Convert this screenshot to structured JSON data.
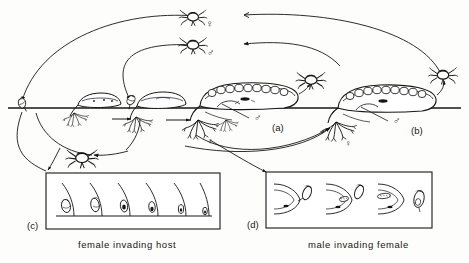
{
  "figure": {
    "background_color": "#fdfdfc",
    "ink_color": "#161616",
    "width": 469,
    "height": 263
  },
  "panels": [
    {
      "id": "a",
      "letter": "(a)",
      "x": 272,
      "y": 123,
      "description": "externa with egg mass on host, male pointer"
    },
    {
      "id": "b",
      "letter": "(b)",
      "x": 411,
      "y": 126,
      "description": "mature externa releasing larvae"
    },
    {
      "id": "c",
      "letter": "(c)",
      "x": 27,
      "y": 221,
      "description": "inset box, six stages"
    },
    {
      "id": "d",
      "letter": "(d)",
      "x": 247,
      "y": 220,
      "description": "inset box, four stages"
    }
  ],
  "captions": [
    {
      "id": "caption-c",
      "text": "female  invading  host",
      "x": 78,
      "y": 240
    },
    {
      "id": "caption-d",
      "text": "male  invading  female",
      "x": 308,
      "y": 240
    }
  ],
  "sex_symbols": [
    {
      "id": "free-female",
      "glyph": "♀",
      "x": 206,
      "y": 19,
      "size": "lg"
    },
    {
      "id": "free-male",
      "glyph": "♂",
      "x": 207,
      "y": 48,
      "size": "lg"
    },
    {
      "id": "internal-male-a",
      "glyph": "♂",
      "x": 254,
      "y": 113,
      "size": "lg"
    },
    {
      "id": "internal-male-b",
      "glyph": "♂",
      "x": 393,
      "y": 116,
      "size": "lg"
    },
    {
      "id": "host-female-a",
      "glyph": "♀",
      "x": 207,
      "y": 137,
      "size": "sm"
    },
    {
      "id": "host-female-b",
      "glyph": "♀",
      "x": 345,
      "y": 139,
      "size": "sm"
    }
  ],
  "inset_c": {
    "box": {
      "x": 46,
      "y": 173,
      "w": 174,
      "h": 56
    },
    "stage_count": 6,
    "baseline_y": 216
  },
  "inset_d": {
    "box": {
      "x": 266,
      "y": 172,
      "w": 166,
      "h": 56
    },
    "stage_count": 4
  },
  "substrate_line": {
    "y": 108,
    "x1": 8,
    "x2": 461
  }
}
